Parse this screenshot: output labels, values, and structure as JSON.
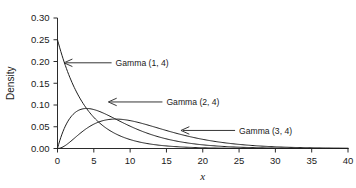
{
  "chart_data": {
    "type": "line",
    "title": "",
    "xlabel": "x",
    "ylabel": "Density",
    "xlim": [
      0,
      40
    ],
    "ylim": [
      0,
      0.3
    ],
    "grid": false,
    "legend_position": "inline-annotations",
    "x_ticks": [
      "0",
      "5",
      "10",
      "15",
      "20",
      "25",
      "30",
      "35",
      "40"
    ],
    "x_tick_values": [
      0,
      5,
      10,
      15,
      20,
      25,
      30,
      35,
      40
    ],
    "y_ticks": [
      "0.00",
      "0.05",
      "0.10",
      "0.15",
      "0.20",
      "0.25",
      "0.30"
    ],
    "y_tick_values": [
      0.0,
      0.05,
      0.1,
      0.15,
      0.2,
      0.25,
      0.3
    ],
    "series": [
      {
        "name": "Gamma (1, 4)",
        "shape": 1,
        "scale": 4,
        "peak_x": 0,
        "peak_y": 0.25,
        "x": [
          0,
          1,
          2,
          3,
          4,
          5,
          6,
          8,
          10,
          12,
          14,
          16,
          18,
          20,
          24,
          28,
          32,
          36,
          40
        ],
        "values": [
          0.25,
          0.1947,
          0.1516,
          0.1181,
          0.092,
          0.0716,
          0.0558,
          0.0338,
          0.0205,
          0.0124,
          0.0076,
          0.0046,
          0.0028,
          0.0017,
          0.0006,
          0.0002,
          0.0001,
          0.0,
          0.0
        ]
      },
      {
        "name": "Gamma (2, 4)",
        "shape": 2,
        "scale": 4,
        "peak_x": 4,
        "peak_y": 0.092,
        "x": [
          0,
          1,
          2,
          3,
          4,
          5,
          6,
          8,
          10,
          12,
          14,
          16,
          18,
          20,
          24,
          28,
          32,
          36,
          40
        ],
        "values": [
          0.0,
          0.0487,
          0.0758,
          0.0886,
          0.092,
          0.0895,
          0.0837,
          0.0677,
          0.0513,
          0.0373,
          0.0265,
          0.0183,
          0.0125,
          0.0084,
          0.0037,
          0.0015,
          0.0006,
          0.0002,
          0.0001
        ]
      },
      {
        "name": "Gamma (3, 4)",
        "shape": 3,
        "scale": 4,
        "peak_x": 8,
        "peak_y": 0.0752,
        "x": [
          0,
          1,
          2,
          3,
          4,
          5,
          6,
          8,
          10,
          12,
          14,
          16,
          18,
          20,
          24,
          28,
          32,
          36,
          40
        ],
        "values": [
          0.0,
          0.0061,
          0.0189,
          0.0332,
          0.046,
          0.0559,
          0.0628,
          0.0677,
          0.0641,
          0.056,
          0.0464,
          0.0366,
          0.0281,
          0.021,
          0.0111,
          0.0055,
          0.0026,
          0.0012,
          0.0005
        ]
      }
    ],
    "annotations": [
      {
        "text": "Gamma (1, 4)",
        "points_to_x": 0.9,
        "points_to_y": 0.197,
        "label_x": 8.0,
        "label_y": 0.197
      },
      {
        "text": "Gamma (2, 4)",
        "points_to_x": 7.0,
        "points_to_y": 0.107,
        "label_x": 15.0,
        "label_y": 0.107
      },
      {
        "text": "Gamma (3, 4)",
        "points_to_x": 17.0,
        "points_to_y": 0.0415,
        "label_x": 25.0,
        "label_y": 0.0415
      }
    ],
    "colors": {
      "curve": "#1f1f1f",
      "axis": "#2b2b2b",
      "text": "#1a1a1a",
      "background": "#ffffff"
    }
  }
}
